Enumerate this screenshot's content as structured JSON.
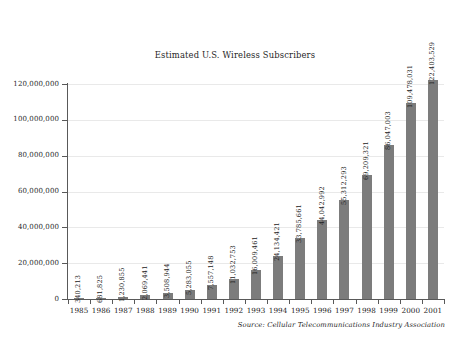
{
  "chart_data": {
    "type": "bar",
    "title": "Estimated U.S. Wireless Subscribers",
    "xlabel": "",
    "ylabel": "",
    "ylim": [
      0,
      120000000
    ],
    "grid": true,
    "legend": "none",
    "orientation": "vertical",
    "bar_color": "#7c7c7c",
    "categories": [
      "1985",
      "1986",
      "1987",
      "1988",
      "1989",
      "1990",
      "1991",
      "1992",
      "1993",
      "1994",
      "1995",
      "1996",
      "1997",
      "1998",
      "1999",
      "2000",
      "2001"
    ],
    "values": [
      340213,
      681825,
      1230855,
      2069441,
      3508944,
      5283055,
      7557148,
      11032753,
      16009461,
      24134421,
      33785661,
      44042992,
      55312293,
      69209321,
      86047003,
      109478031,
      122403529
    ],
    "data_labels": [
      "340,213",
      "681,825",
      "1,230,855",
      "2,069,441",
      "3,508,944",
      "5,283,055",
      "7,557,148",
      "11,032,753",
      "16,009,461",
      "24,134,421",
      "33,785,661",
      "44,042,992",
      "55,312,293",
      "69,209,321",
      "86,047,003",
      "109,478,031",
      "122,403,529"
    ],
    "ytick_values": [
      0,
      20000000,
      40000000,
      60000000,
      80000000,
      100000000,
      120000000
    ],
    "ytick_labels": [
      "0",
      "20,000,000",
      "40,000,000",
      "60,000,000",
      "80,000,000",
      "100,000,000",
      "120,000,000"
    ],
    "annotations": [
      "Source: Cellular Telecommunications Industry Association"
    ]
  },
  "footer": {
    "source": "Source: Cellular Telecommunications Industry Association"
  }
}
